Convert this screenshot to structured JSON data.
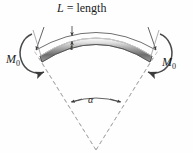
{
  "figure": {
    "labels": {
      "length_prefix": "L",
      "length_text": " = length",
      "moment_left": "M",
      "moment_left_sub": "0",
      "moment_right": "M",
      "moment_right_sub": "0",
      "thickness": "t",
      "angle": "α"
    },
    "colors": {
      "line": "#3b3b3b",
      "dashed": "#8f8f8f",
      "beam_light": "#f2f2f2",
      "beam_mid": "#b9b9b9",
      "beam_dark": "#6a6a6a",
      "text": "#1c1c1c",
      "background": "#ffffff"
    },
    "geometry": {
      "center_x": 96,
      "center_y": 150,
      "beam_radius": 108,
      "beam_thickness": 6,
      "dimension_radius": 122,
      "angle_arc_radius": 52,
      "subtended_angle_deg": 58
    }
  }
}
